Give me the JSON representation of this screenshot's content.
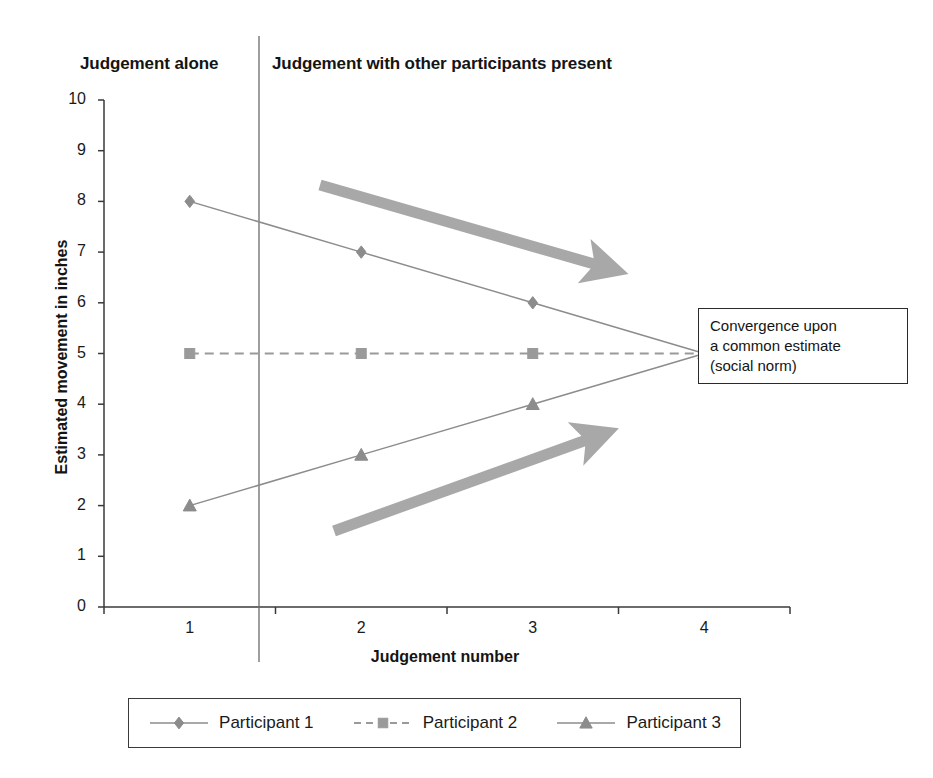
{
  "chart_data": {
    "type": "line",
    "title": "",
    "xlabel": "Judgement number",
    "ylabel": "Estimated movement in inches",
    "categories": [
      "1",
      "2",
      "3",
      "4"
    ],
    "xlim": [
      1,
      4
    ],
    "ylim": [
      0,
      10
    ],
    "ytick_labels": [
      "0",
      "1",
      "2",
      "3",
      "4",
      "5",
      "6",
      "7",
      "8",
      "9",
      "10"
    ],
    "ytick_values": [
      0,
      1,
      2,
      3,
      4,
      5,
      6,
      7,
      8,
      9,
      10
    ],
    "grid": false,
    "legend_position": "bottom",
    "series": [
      {
        "name": "Participant 1",
        "marker": "diamond",
        "line_style": "solid",
        "color": "#8c8c8c",
        "values": [
          8,
          7,
          6,
          5
        ]
      },
      {
        "name": "Participant 2",
        "marker": "square",
        "line_style": "dashed",
        "color": "#9a9a9a",
        "values": [
          5,
          5,
          5,
          5
        ]
      },
      {
        "name": "Participant 3",
        "marker": "triangle",
        "line_style": "solid",
        "color": "#8c8c8c",
        "values": [
          2,
          3,
          4,
          5
        ]
      }
    ],
    "annotations": [
      {
        "id": "divider",
        "type": "vertical-line",
        "x": 1.5,
        "label": ""
      },
      {
        "id": "region-left",
        "type": "text",
        "text": "Judgement alone"
      },
      {
        "id": "region-right",
        "type": "text",
        "text": "Judgement with other participants present"
      },
      {
        "id": "convergence-callout",
        "type": "box-text",
        "lines": [
          "Convergence upon",
          "a common estimate",
          "(social norm)"
        ]
      },
      {
        "id": "arrow-upper",
        "type": "arrow",
        "direction": "down-right",
        "color": "#a8a8a8"
      },
      {
        "id": "arrow-lower",
        "type": "arrow",
        "direction": "up-right",
        "color": "#a8a8a8"
      }
    ]
  },
  "headers": {
    "left": "Judgement alone",
    "right": "Judgement with other participants present"
  },
  "axes": {
    "y_title": "Estimated movement in inches",
    "x_title": "Judgement number",
    "y_labels": [
      "10",
      "9",
      "8",
      "7",
      "6",
      "5",
      "4",
      "3",
      "2",
      "1",
      "0"
    ],
    "x_labels": [
      "1",
      "2",
      "3",
      "4"
    ]
  },
  "callout": {
    "line1": "Convergence upon",
    "line2": "a common estimate",
    "line3": "(social norm)"
  },
  "legend": {
    "items": [
      {
        "label": "Participant 1",
        "marker": "diamond-marker",
        "style": "solid"
      },
      {
        "label": "Participant 2",
        "marker": "square-marker",
        "style": "dashed"
      },
      {
        "label": "Participant 3",
        "marker": "triangle-marker",
        "style": "solid"
      }
    ]
  },
  "colors": {
    "series": "#8c8c8c",
    "axis": "#3a3a3a",
    "arrow": "#a8a8a8",
    "text": "#1a1a1a"
  }
}
